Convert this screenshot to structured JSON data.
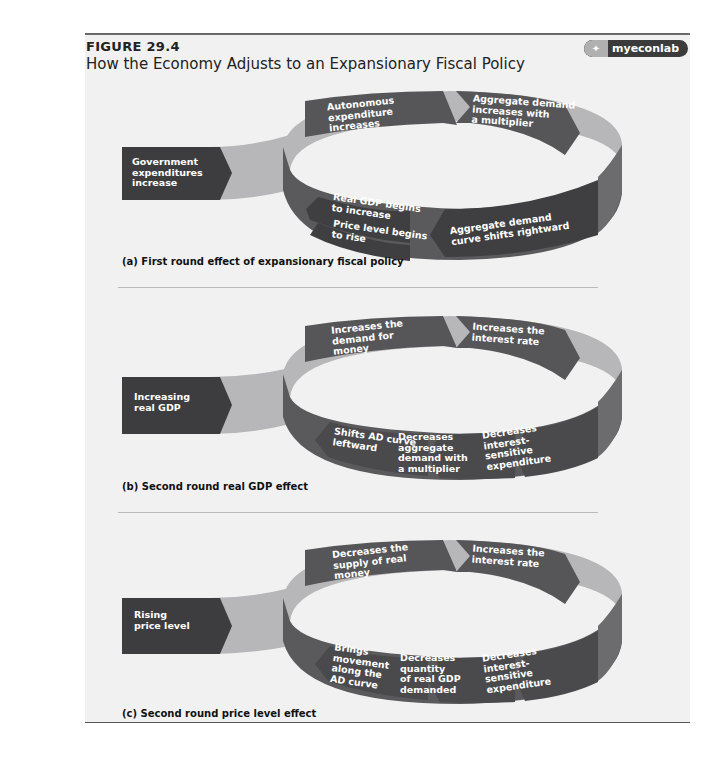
{
  "header": {
    "figure_label": "FIGURE 29.4",
    "title": "How the Economy Adjusts to an Expansionary Fiscal Policy",
    "badge": "myeconlab"
  },
  "colors": {
    "dark_box": "#3d3d3f",
    "ring_dark": "#5a5a5c",
    "ring_light": "#b7b7b9",
    "background": "#f1f1f1"
  },
  "panels": [
    {
      "caption": "(a) First round effect of expansionary fiscal policy",
      "input": "Government\nexpenditures\nincrease",
      "steps": {
        "top_left": "Autonomous\nexpenditure\nincreases",
        "top_right": "Aggregate demand\nincreases with\na multiplier",
        "bottom_right": "Aggregate demand\ncurve shifts rightward",
        "bottom_left_1": "Real GDP begins\nto increase",
        "bottom_left_2": "Price level begins\nto rise"
      }
    },
    {
      "caption": "(b) Second round real GDP effect",
      "input": "Increasing\nreal GDP",
      "steps": {
        "top_left": "Increases the\ndemand for\nmoney",
        "top_right": "Increases the\ninterest rate",
        "bottom_right": "Decreases\ninterest-\nsensitive\nexpenditure",
        "bottom_mid": "Decreases\naggregate\ndemand with\na multiplier",
        "bottom_left": "Shifts AD curve\nleftward"
      }
    },
    {
      "caption": "(c) Second round price level effect",
      "input": "Rising\nprice level",
      "steps": {
        "top_left": "Decreases the\nsupply of real\nmoney",
        "top_right": "Increases the\ninterest rate",
        "bottom_right": "Decreases\ninterest-\nsensitive\nexpenditure",
        "bottom_mid": "Decreases\nquantity\nof real GDP\ndemanded",
        "bottom_left": "Brings\nmovement\nalong the\nAD curve"
      }
    }
  ]
}
